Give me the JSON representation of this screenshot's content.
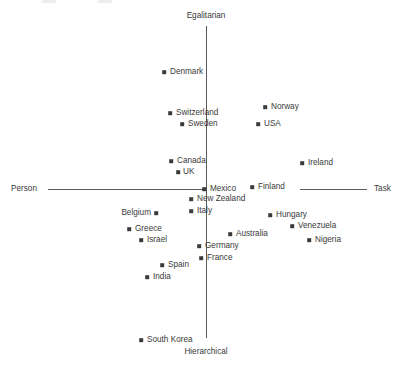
{
  "chart_data": {
    "type": "scatter",
    "title": "",
    "subtitle": "",
    "xlabel": "",
    "ylabel": "",
    "grid": false,
    "legend": false,
    "axis_labels": {
      "top": "Egalitarian",
      "bottom": "Hierarchical",
      "left": "Person",
      "right": "Task"
    },
    "axis_ranges": {
      "x": [
        "Person",
        "Task"
      ],
      "y": [
        "Hierarchical",
        "Egalitarian"
      ]
    },
    "colors": {
      "marker": "#3a3a3a",
      "axis": "#595959",
      "text": "#3a3a3a",
      "background": "#ffffff"
    },
    "points": [
      {
        "label": "Denmark",
        "px": 164,
        "py": 72,
        "lx": 170,
        "ly": 72,
        "side": "right"
      },
      {
        "label": "Norway",
        "px": 265,
        "py": 107,
        "lx": 271,
        "ly": 107,
        "side": "right"
      },
      {
        "label": "Switzerland",
        "px": 170,
        "py": 113,
        "lx": 176,
        "ly": 113,
        "side": "right"
      },
      {
        "label": "Sweden",
        "px": 182,
        "py": 124,
        "lx": 188,
        "ly": 124,
        "side": "right"
      },
      {
        "label": "USA",
        "px": 258,
        "py": 124,
        "lx": 264,
        "ly": 124,
        "side": "right"
      },
      {
        "label": "Canada",
        "px": 171,
        "py": 161,
        "lx": 177,
        "ly": 161,
        "side": "right"
      },
      {
        "label": "Ireland",
        "px": 302,
        "py": 163,
        "lx": 308,
        "ly": 163,
        "side": "right"
      },
      {
        "label": "UK",
        "px": 178,
        "py": 172,
        "lx": 183,
        "ly": 172,
        "side": "right"
      },
      {
        "label": "Finland",
        "px": 252,
        "py": 187,
        "lx": 258,
        "ly": 187,
        "side": "right"
      },
      {
        "label": "Mexico",
        "px": 204,
        "py": 189,
        "lx": 210,
        "ly": 189,
        "side": "right"
      },
      {
        "label": "New Zealand",
        "px": 191,
        "py": 199,
        "lx": 197,
        "ly": 199,
        "side": "right"
      },
      {
        "label": "Italy",
        "px": 191,
        "py": 211,
        "lx": 197,
        "ly": 211,
        "side": "right"
      },
      {
        "label": "Belgium",
        "px": 156,
        "py": 213,
        "lx": 151,
        "ly": 213,
        "side": "left"
      },
      {
        "label": "Hungary",
        "px": 270,
        "py": 215,
        "lx": 276,
        "ly": 215,
        "side": "right"
      },
      {
        "label": "Venezuela",
        "px": 292,
        "py": 226,
        "lx": 298,
        "ly": 226,
        "side": "right"
      },
      {
        "label": "Greece",
        "px": 129,
        "py": 229,
        "lx": 135,
        "ly": 229,
        "side": "right"
      },
      {
        "label": "Australia",
        "px": 230,
        "py": 234,
        "lx": 236,
        "ly": 234,
        "side": "right"
      },
      {
        "label": "Israel",
        "px": 141,
        "py": 240,
        "lx": 147,
        "ly": 240,
        "side": "right"
      },
      {
        "label": "Nigeria",
        "px": 309,
        "py": 240,
        "lx": 315,
        "ly": 240,
        "side": "right"
      },
      {
        "label": "Germany",
        "px": 199,
        "py": 246,
        "lx": 205,
        "ly": 246,
        "side": "right"
      },
      {
        "label": "France",
        "px": 201,
        "py": 258,
        "lx": 207,
        "ly": 258,
        "side": "right"
      },
      {
        "label": "Spain",
        "px": 162,
        "py": 265,
        "lx": 168,
        "ly": 265,
        "side": "right"
      },
      {
        "label": "India",
        "px": 147,
        "py": 277,
        "lx": 153,
        "ly": 277,
        "side": "right"
      },
      {
        "label": "South Korea",
        "px": 141,
        "py": 340,
        "lx": 147,
        "ly": 340,
        "side": "right"
      }
    ],
    "axes_geometry": {
      "vertical_x": 206,
      "vertical_top": 26,
      "vertical_bottom": 338,
      "horizontal_y": 189,
      "horizontal_left_start": 48,
      "horizontal_left_end": 203,
      "horizontal_right_start": 300,
      "horizontal_right_end": 367,
      "label_top_x": 206,
      "label_top_y": 17,
      "label_bottom_x": 206,
      "label_bottom_y": 352,
      "label_left_x": 10,
      "label_left_y": 189,
      "label_right_x": 374,
      "label_right_y": 189
    }
  }
}
